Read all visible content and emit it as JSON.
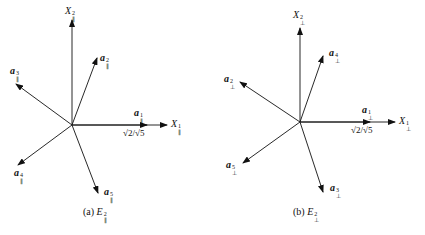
{
  "figure": {
    "panel_a": {
      "caption_prefix": "(a) ",
      "caption_main": "E",
      "caption_sup": "2",
      "caption_sub": "∥",
      "axis_x": {
        "main": "X",
        "sup": "1",
        "sub": "∥"
      },
      "axis_y": {
        "main": "X",
        "sup": "2",
        "sub": "∥"
      },
      "vectors": [
        {
          "main": "a",
          "sup": "1",
          "sub": "∥"
        },
        {
          "main": "a",
          "sup": "2",
          "sub": "∥"
        },
        {
          "main": "a",
          "sup": "3",
          "sub": "∥"
        },
        {
          "main": "a",
          "sup": "4",
          "sub": "∥"
        },
        {
          "main": "a",
          "sup": "5",
          "sub": "∥"
        }
      ],
      "scale_label": "√2/√5"
    },
    "panel_b": {
      "caption_prefix": "(b) ",
      "caption_main": "E",
      "caption_sup": "2",
      "caption_sub": "⊥",
      "axis_x": {
        "main": "X",
        "sup": "1",
        "sub": "⊥"
      },
      "axis_y": {
        "main": "X",
        "sup": "2",
        "sub": "⊥"
      },
      "vectors": [
        {
          "main": "a",
          "sup": "1",
          "sub": "⊥"
        },
        {
          "main": "a",
          "sup": "2",
          "sub": "⊥"
        },
        {
          "main": "a",
          "sup": "3",
          "sub": "⊥"
        },
        {
          "main": "a",
          "sup": "4",
          "sub": "⊥"
        },
        {
          "main": "a",
          "sup": "5",
          "sub": "⊥"
        }
      ],
      "scale_label": "√2/√5"
    }
  }
}
